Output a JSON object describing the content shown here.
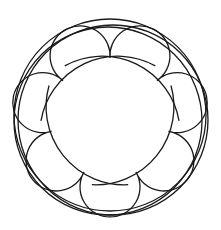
{
  "figure": {
    "stroke_color": "#1a1a1a",
    "background_color": "#ffffff",
    "lobe_count": 7,
    "center": [
      110,
      118
    ],
    "cusp_radius": 60,
    "lobe_arc_radius": 30,
    "outer_circles": [
      {
        "cx": 110,
        "cy": 115,
        "r": 96
      },
      {
        "cx": 113,
        "cy": 120,
        "r": 95
      },
      {
        "cx": 108,
        "cy": 121,
        "r": 94
      }
    ]
  }
}
